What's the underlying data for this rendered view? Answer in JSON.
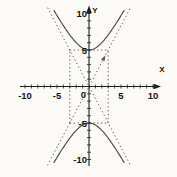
{
  "figure": {
    "background": "#fbfaf6",
    "axis_color": "#1f1f1f",
    "curve_color": "#4a4a4a",
    "dash_color": "#5a5a5a",
    "label_color": "#141414"
  },
  "axes": {
    "x_label": "X",
    "y_label": "Y",
    "origin_label": "0"
  },
  "chart_data": {
    "type": "line",
    "equation": "y^2/25 - x^2/9 = 1",
    "a": 5,
    "b": 3,
    "orientation": "vertical",
    "vertices": [
      [
        0,
        5
      ],
      [
        0,
        -5
      ]
    ],
    "asymptote_slope": 1.6667,
    "asymptotes": [
      "y = (5/3)x",
      "y = -(5/3)x"
    ],
    "central_box": {
      "x_min": -3,
      "x_max": 3,
      "y_min": -5,
      "y_max": 5
    },
    "xlim": [
      -10.8,
      11.2
    ],
    "ylim": [
      -10.8,
      10.8
    ],
    "tick_step": 1,
    "x_labeled_ticks": [
      -10,
      -5,
      5,
      10
    ],
    "y_labeled_ticks": [
      10,
      5,
      -5,
      -10
    ],
    "grid": false,
    "legend": false,
    "series": [
      {
        "name": "upper branch",
        "points": [
          [
            -5.5,
            10.44
          ],
          [
            -5,
            9.72
          ],
          [
            -4,
            8.33
          ],
          [
            -3,
            7.07
          ],
          [
            -2,
            6.01
          ],
          [
            -1,
            5.27
          ],
          [
            0,
            5
          ],
          [
            1,
            5.27
          ],
          [
            2,
            6.01
          ],
          [
            3,
            7.07
          ],
          [
            4,
            8.33
          ],
          [
            5,
            9.72
          ],
          [
            5.5,
            10.44
          ]
        ]
      },
      {
        "name": "lower branch",
        "points": [
          [
            -5.5,
            -10.44
          ],
          [
            -5,
            -9.72
          ],
          [
            -4,
            -8.33
          ],
          [
            -3,
            -7.07
          ],
          [
            -2,
            -6.01
          ],
          [
            -1,
            -5.27
          ],
          [
            0,
            -5
          ],
          [
            1,
            -5.27
          ],
          [
            2,
            -6.01
          ],
          [
            3,
            -7.07
          ],
          [
            4,
            -8.33
          ],
          [
            5,
            -9.72
          ],
          [
            5.5,
            -10.44
          ]
        ]
      }
    ],
    "asymptote_arrow_at": [
      2.35,
      3.92
    ]
  }
}
